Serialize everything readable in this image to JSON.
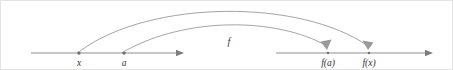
{
  "figure": {
    "background_color": "#ffffff",
    "line_color": "#8f8f8f",
    "arc_color": "#9a9a9a",
    "dot_color": "#6f6f6f",
    "label_color": "#333333"
  },
  "domain_axis": {
    "name": "domain-number-line",
    "start_x": 30,
    "end_x": 183,
    "y": 52,
    "points": [
      {
        "id": "x",
        "label": "x",
        "cx": 78,
        "label_x": 78,
        "label_y": 65
      },
      {
        "id": "a",
        "label": "a",
        "cx": 123,
        "label_x": 123,
        "label_y": 65
      }
    ]
  },
  "codomain_axis": {
    "name": "codomain-number-line",
    "start_x": 275,
    "end_x": 432,
    "y": 52,
    "points": [
      {
        "id": "fa",
        "label": "f(a)",
        "cx": 327,
        "label_x": 327,
        "label_y": 65
      },
      {
        "id": "fx",
        "label": "f(x)",
        "cx": 368,
        "label_x": 368,
        "label_y": 65
      }
    ]
  },
  "mapping_arcs": [
    {
      "id": "arc-x-to-fx",
      "from_label": "x",
      "to_label": "f(x)",
      "path": "M 79 50 C 150 -2 300 -2 367 45",
      "arrow_points": "367,49 361.5,39.5 372.5,41.5"
    },
    {
      "id": "arc-a-to-fa",
      "from_label": "a",
      "to_label": "f(a)",
      "path": "M 124 50 C 185 16 275 16 326 45",
      "arrow_points": "326,49 319.5,40.5 330.5,38.5"
    }
  ],
  "function_label": {
    "text": "f",
    "x": 228,
    "y": 44
  }
}
